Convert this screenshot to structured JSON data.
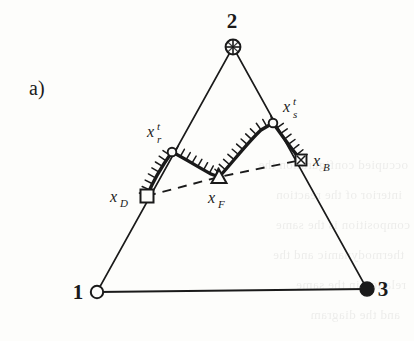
{
  "figure": {
    "panel_label": "a)",
    "caption_letter": "a",
    "background_color": "#fdfdfb",
    "ink_color": "#1a1a1a"
  },
  "vertices": [
    {
      "id": "vertex-1",
      "label": "1",
      "marker": "open-circle",
      "x": 97,
      "y": 292,
      "label_x": 78,
      "label_y": 299
    },
    {
      "id": "vertex-2",
      "label": "2",
      "marker": "crossed-circle",
      "x": 233,
      "y": 47,
      "label_x": 226,
      "label_y": 28
    },
    {
      "id": "vertex-3",
      "label": "3",
      "marker": "filled-circle",
      "x": 367,
      "y": 289,
      "label_x": 378,
      "label_y": 296
    }
  ],
  "nodes": [
    {
      "id": "node-xD",
      "base": "x",
      "sub": "D",
      "prime": "",
      "marker": "open-square",
      "x": 147,
      "y": 196,
      "label_x": 110,
      "label_y": 202
    },
    {
      "id": "node-xr",
      "base": "x",
      "sub": "r",
      "prime": "t",
      "marker": "open-circle-small",
      "x": 172,
      "y": 152,
      "label_x": 147,
      "label_y": 137
    },
    {
      "id": "node-xF",
      "base": "x",
      "sub": "F",
      "prime": "",
      "marker": "open-triangle",
      "x": 219,
      "y": 177,
      "label_x": 208,
      "label_y": 203
    },
    {
      "id": "node-xs",
      "base": "x",
      "sub": "s",
      "prime": "t",
      "marker": "open-circle-small",
      "x": 273,
      "y": 123,
      "label_x": 283,
      "label_y": 112
    },
    {
      "id": "node-xB",
      "base": "x",
      "sub": "B",
      "prime": "",
      "marker": "crossed-square",
      "x": 301,
      "y": 160,
      "label_x": 313,
      "label_y": 166
    }
  ],
  "triangle": {
    "name": "ternary-triangle",
    "edges": [
      {
        "from": "vertex-1",
        "to": "vertex-2"
      },
      {
        "from": "vertex-2",
        "to": "vertex-3"
      },
      {
        "from": "vertex-1",
        "to": "vertex-3"
      }
    ],
    "stroke_width": 1.6
  },
  "dashed_chord": {
    "name": "dashed-tie-line",
    "points": "147,196 219,177 301,160",
    "dash_pattern": "9 7",
    "stroke_width": 1.9
  },
  "bold_front": {
    "name": "hatched-reaction-front",
    "stroke_width": 3.4,
    "hatch_count": 34,
    "hatch_length": 7,
    "segments": [
      {
        "from": "node-xD",
        "to": "node-xr",
        "curve": "slight-concave"
      },
      {
        "from": "node-xr",
        "to": "node-xF",
        "curve": "convex-arc"
      },
      {
        "from": "node-xF",
        "to": "node-xs",
        "curve": "near-straight"
      },
      {
        "from": "node-xs",
        "to": "node-xB",
        "curve": "near-straight"
      }
    ]
  },
  "showthrough_lines": [
    {
      "text": "occupied configuration the",
      "x": 6,
      "y": 150
    },
    {
      "text": "interior of the reaction",
      "x": 12,
      "y": 180
    },
    {
      "text": "composition is the same",
      "x": 4,
      "y": 210
    },
    {
      "text": "thermodynamic and the",
      "x": 10,
      "y": 240
    },
    {
      "text": "relation in the same",
      "x": 8,
      "y": 270
    },
    {
      "text": "and the diagram",
      "x": 14,
      "y": 300
    }
  ]
}
